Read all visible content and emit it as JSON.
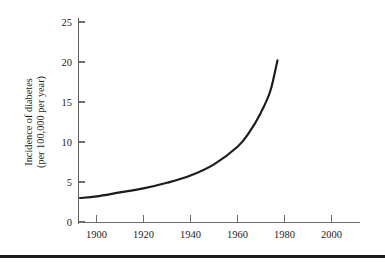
{
  "figure": {
    "background_color": "#ffffff",
    "curve_color": "#1b1b1b",
    "axis_color": "#6d6d6d",
    "text_color": "#232323"
  },
  "axis_title": {
    "line1": "Incidence of diabetes",
    "line2": "(per 100,000 per year)"
  },
  "y_ticks": [
    {
      "label": "0",
      "value": 0
    },
    {
      "label": "5",
      "value": 5
    },
    {
      "label": "10",
      "value": 10
    },
    {
      "label": "15",
      "value": 15
    },
    {
      "label": "20",
      "value": 20
    },
    {
      "label": "25",
      "value": 25
    }
  ],
  "x_ticks": [
    {
      "label": "1900",
      "value": 1900
    },
    {
      "label": "1920",
      "value": 1920
    },
    {
      "label": "1940",
      "value": 1940
    },
    {
      "label": "1960",
      "value": 1960
    },
    {
      "label": "1980",
      "value": 1980
    },
    {
      "label": "2000",
      "value": 2000
    }
  ],
  "bottom_rule": {
    "color": "#1c1c1c"
  },
  "chart_data": {
    "type": "line",
    "title": "",
    "subtitle": "",
    "xlabel": "",
    "ylabel": "Incidence of diabetes (per 100,000 per year)",
    "xlim": [
      1893,
      2008
    ],
    "ylim": [
      0,
      26
    ],
    "grid": false,
    "legend": false,
    "xticks": [
      1900,
      1920,
      1940,
      1960,
      1980,
      2000
    ],
    "yticks": [
      0,
      5,
      10,
      15,
      20,
      25
    ],
    "series": [
      {
        "name": "Incidence of diabetes",
        "color": "#1b1b1b",
        "x": [
          1893,
          1900,
          1910,
          1920,
          1930,
          1940,
          1950,
          1960,
          1965,
          1970,
          1974,
          1977
        ],
        "values": [
          3.0,
          3.2,
          3.7,
          4.2,
          4.9,
          5.8,
          7.2,
          9.4,
          11.2,
          13.7,
          16.4,
          20.2
        ]
      }
    ],
    "annotations": [
      "Curve rises exponentially from about 3 per 100,000 per year near 1893 to about 20 per 100,000 per year near 1977.",
      "Data curve terminates before 1980; x-axis continues to 2000 with no data."
    ]
  }
}
